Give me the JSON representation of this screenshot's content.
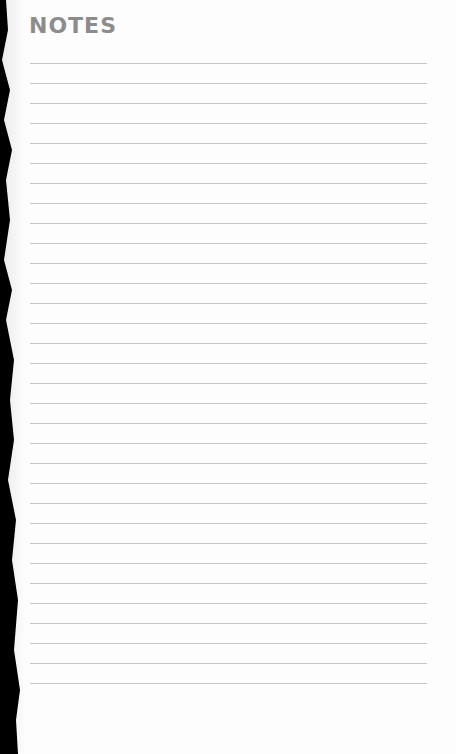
{
  "page": {
    "title": "NOTES",
    "line_count": 32,
    "line_color": "#c6c6c6",
    "title_color": "#8c8c8c"
  }
}
